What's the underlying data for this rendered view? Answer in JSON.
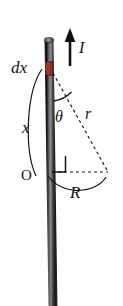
{
  "figure": {
    "background_color": "#ffffff",
    "width": 123,
    "height": 306
  },
  "rod": {
    "name": "vertical-current-rod",
    "color_dark": "#1b1b1b",
    "color_mid": "#4a4a4a",
    "color_highlight": "#8c8c8c",
    "cap_color": "#6e6e6e"
  },
  "element": {
    "name": "current-element-dx",
    "color": "#8c3a2b",
    "color_dark": "#5d2318",
    "label": "dx"
  },
  "labels": {
    "current": "I",
    "element": "dx",
    "distance_along_rod": "x",
    "origin": "O",
    "radial_distance": "r",
    "perpendicular_distance": "R",
    "angle": "θ"
  },
  "geometry": {
    "line_color": "#1a1a1a",
    "dash_pattern": "3,3",
    "right_angle_marker": true,
    "triangle_vertices": {
      "element_point": [
        52,
        70
      ],
      "origin_point": [
        52,
        172
      ],
      "field_point": [
        108,
        172
      ]
    }
  }
}
